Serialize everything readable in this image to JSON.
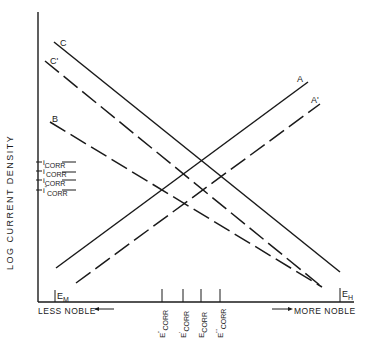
{
  "diagram": {
    "type": "evans-polarization-diagram",
    "y_axis_label": "LOG CURRENT DENSITY",
    "x_axis": {
      "left_label": "LESS NOBLE",
      "right_label": "MORE NOBLE",
      "left_marker": {
        "main": "E",
        "sub": "M"
      },
      "right_marker": {
        "main": "E",
        "sub": "H"
      }
    },
    "current_labels": [
      {
        "main": "i",
        "sup": "",
        "sub": "CORR"
      },
      {
        "main": "i",
        "sup": "'",
        "sub": "CORR"
      },
      {
        "main": "i",
        "sup": "",
        "sub": "CORR"
      },
      {
        "main": "i",
        "sup": "\"",
        "sub": "CORR"
      }
    ],
    "potential_labels": [
      {
        "main": "E",
        "sup": "\"",
        "sub": "CORR"
      },
      {
        "main": "E",
        "sup": "'",
        "sub": "CORR"
      },
      {
        "main": "E",
        "sup": "",
        "sub": "CORR"
      },
      {
        "main": "E",
        "sup": "'''",
        "sub": "CORR"
      }
    ],
    "lines": [
      {
        "name": "A",
        "style": "solid",
        "from": [
          56,
          268
        ],
        "to": [
          308,
          82
        ]
      },
      {
        "name": "A'",
        "style": "dashed",
        "from": [
          76,
          283
        ],
        "to": [
          320,
          104
        ]
      },
      {
        "name": "B",
        "style": "dashed",
        "from": [
          50,
          122
        ],
        "to": [
          322,
          287
        ]
      },
      {
        "name": "C",
        "style": "solid",
        "from": [
          54,
          42
        ],
        "to": [
          340,
          272
        ]
      },
      {
        "name": "C'",
        "style": "dashed",
        "from": [
          45,
          61
        ],
        "to": [
          322,
          287
        ]
      }
    ],
    "line_labels": {
      "A": "A",
      "A_prime": "A'",
      "B": "B",
      "C": "C",
      "C_prime": "C'"
    },
    "color": "#1a1a1a"
  }
}
